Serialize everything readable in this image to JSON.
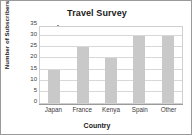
{
  "chart_data": {
    "type": "bar",
    "title": "Travel Survey",
    "xlabel": "Country",
    "ylabel": "Number of Subscribers",
    "categories": [
      "Japan",
      "France",
      "Kenya",
      "Spain",
      "Other"
    ],
    "values": [
      15,
      25,
      20,
      30,
      30
    ],
    "ylim": [
      0,
      35
    ],
    "yticks": [
      0,
      5,
      10,
      15,
      20,
      25,
      30,
      35
    ],
    "ytick_labels": [
      "0",
      "5",
      "10",
      "15",
      "20",
      "25",
      "30",
      "35"
    ],
    "grid": "horizontal",
    "legend": "none",
    "bar_color": "#c9c9c9",
    "plot_border_color": "#cfcfcf",
    "axis_color": "#9a9a9a",
    "frame_color": "#9a9a9a",
    "background": "#ffffff"
  }
}
